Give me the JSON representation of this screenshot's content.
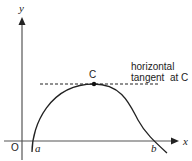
{
  "diagram": {
    "axes": {
      "x_label": "x",
      "y_label": "y",
      "origin_label": "O"
    },
    "points": {
      "a_label": "a",
      "b_label": "b",
      "c_label": "C"
    },
    "annotation": {
      "line1": "horizontal",
      "line2": "tangent  at C"
    },
    "colors": {
      "stroke": "#222222",
      "axis": "#555555"
    }
  }
}
